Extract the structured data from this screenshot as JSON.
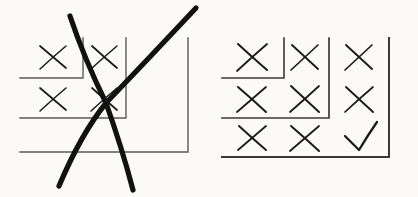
{
  "figure": {
    "background_color": "#fbfaf6",
    "ink_color": "#1a1a1a",
    "rule_color": "#4a4a4a",
    "width": 418,
    "height": 197
  },
  "panels": [
    {
      "id": "left",
      "name": "rejected-diagram",
      "status": "rejected",
      "struck_out": true,
      "strike_mark": "large-x",
      "brackets": [
        {
          "name": "inner-bracket",
          "vertical_x": 83,
          "vertical_top": 38,
          "corner_y": 78,
          "horizontal_left": 20
        },
        {
          "name": "middle-bracket",
          "vertical_x": 126,
          "vertical_top": 38,
          "corner_y": 118,
          "horizontal_left": 20
        },
        {
          "name": "outer-bracket",
          "vertical_x": 188,
          "vertical_top": 38,
          "corner_y": 152,
          "horizontal_left": 20
        }
      ],
      "cells": [
        {
          "row": 1,
          "col": 1,
          "mark": "x",
          "cx": 53,
          "cy": 57
        },
        {
          "row": 1,
          "col": 2,
          "mark": "x",
          "cx": 104,
          "cy": 57
        },
        {
          "row": 1,
          "col": 3,
          "mark": "none",
          "cx": 157,
          "cy": 57
        },
        {
          "row": 2,
          "col": 1,
          "mark": "x",
          "cx": 53,
          "cy": 99
        },
        {
          "row": 2,
          "col": 2,
          "mark": "x",
          "cx": 104,
          "cy": 99
        },
        {
          "row": 2,
          "col": 3,
          "mark": "none",
          "cx": 157,
          "cy": 99
        },
        {
          "row": 3,
          "col": 1,
          "mark": "none",
          "cx": 53,
          "cy": 137
        },
        {
          "row": 3,
          "col": 2,
          "mark": "none",
          "cx": 104,
          "cy": 137
        },
        {
          "row": 3,
          "col": 3,
          "mark": "none",
          "cx": 157,
          "cy": 137
        }
      ],
      "caption": "rejected"
    },
    {
      "id": "right",
      "name": "accepted-diagram",
      "status": "accepted",
      "struck_out": false,
      "strike_mark": "none",
      "brackets": [
        {
          "name": "inner-bracket",
          "vertical_x": 284,
          "vertical_top": 38,
          "corner_y": 78,
          "horizontal_left": 222
        },
        {
          "name": "middle-bracket",
          "vertical_x": 329,
          "vertical_top": 38,
          "corner_y": 118,
          "horizontal_left": 222
        },
        {
          "name": "outer-bracket",
          "vertical_x": 389,
          "vertical_top": 38,
          "corner_y": 157,
          "horizontal_left": 222
        }
      ],
      "cells": [
        {
          "row": 1,
          "col": 1,
          "mark": "x",
          "cx": 252,
          "cy": 57
        },
        {
          "row": 1,
          "col": 2,
          "mark": "x",
          "cx": 305,
          "cy": 57
        },
        {
          "row": 1,
          "col": 3,
          "mark": "x",
          "cx": 359,
          "cy": 57
        },
        {
          "row": 2,
          "col": 1,
          "mark": "x",
          "cx": 252,
          "cy": 99
        },
        {
          "row": 2,
          "col": 2,
          "mark": "x",
          "cx": 305,
          "cy": 99
        },
        {
          "row": 2,
          "col": 3,
          "mark": "x",
          "cx": 359,
          "cy": 99
        },
        {
          "row": 3,
          "col": 1,
          "mark": "x",
          "cx": 252,
          "cy": 138
        },
        {
          "row": 3,
          "col": 2,
          "mark": "x",
          "cx": 305,
          "cy": 138
        },
        {
          "row": 3,
          "col": 3,
          "mark": "check",
          "cx": 359,
          "cy": 138
        }
      ],
      "caption": "accepted"
    }
  ],
  "strike": {
    "name": "strike-out-x",
    "stroke_1": {
      "from": [
        70,
        16
      ],
      "to": [
        33,
        190
      ]
    },
    "stroke_2": {
      "from": [
        196,
        8
      ],
      "to": [
        175,
        190
      ]
    },
    "crossing_point": [
      106,
      103
    ],
    "stroke_width": 5
  }
}
